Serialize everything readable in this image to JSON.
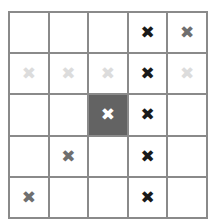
{
  "widget": {
    "name": "cross-mark-grid",
    "rows": 5,
    "columns": 5,
    "mark_glyph": "✖",
    "colors": {
      "background": "#ffffff",
      "gridline": "#8a8a8a",
      "selected_cell": "#636363",
      "mark_dark": "#1a1a1a",
      "mark_mid": "#6f6f6f",
      "mark_light": "#dcdcdc",
      "mark_white": "#ffffff"
    }
  },
  "grid": {
    "cells": [
      [
        {
          "mark": "",
          "style": "none",
          "selected": false
        },
        {
          "mark": "",
          "style": "none",
          "selected": false
        },
        {
          "mark": "",
          "style": "none",
          "selected": false
        },
        {
          "mark": "✖",
          "style": "dark",
          "selected": false
        },
        {
          "mark": "✖",
          "style": "mid",
          "selected": false
        }
      ],
      [
        {
          "mark": "✖",
          "style": "light",
          "selected": false
        },
        {
          "mark": "✖",
          "style": "light",
          "selected": false
        },
        {
          "mark": "✖",
          "style": "light",
          "selected": false
        },
        {
          "mark": "✖",
          "style": "dark",
          "selected": false
        },
        {
          "mark": "✖",
          "style": "light",
          "selected": false
        }
      ],
      [
        {
          "mark": "",
          "style": "none",
          "selected": false
        },
        {
          "mark": "",
          "style": "none",
          "selected": false
        },
        {
          "mark": "✖",
          "style": "white",
          "selected": true
        },
        {
          "mark": "✖",
          "style": "dark",
          "selected": false
        },
        {
          "mark": "",
          "style": "none",
          "selected": false
        }
      ],
      [
        {
          "mark": "",
          "style": "none",
          "selected": false
        },
        {
          "mark": "✖",
          "style": "mid",
          "selected": false
        },
        {
          "mark": "",
          "style": "none",
          "selected": false
        },
        {
          "mark": "✖",
          "style": "dark",
          "selected": false
        },
        {
          "mark": "",
          "style": "none",
          "selected": false
        }
      ],
      [
        {
          "mark": "✖",
          "style": "mid",
          "selected": false
        },
        {
          "mark": "",
          "style": "none",
          "selected": false
        },
        {
          "mark": "",
          "style": "none",
          "selected": false
        },
        {
          "mark": "✖",
          "style": "dark",
          "selected": false
        },
        {
          "mark": "",
          "style": "none",
          "selected": false
        }
      ]
    ]
  }
}
